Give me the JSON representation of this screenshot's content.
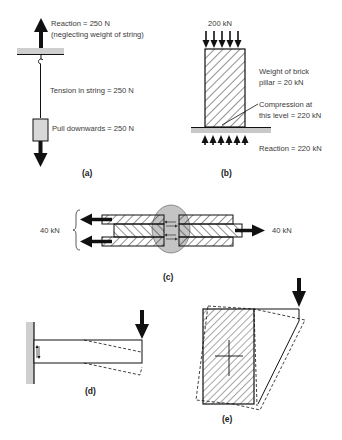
{
  "figure": {
    "panels": [
      {
        "id": "a",
        "caption": "(a)",
        "concept": "tension",
        "labels": {
          "reaction_line1": "Reaction = 250 N",
          "reaction_line2": "(neglecting weight of string)",
          "tension": "Tension in string = 250 N",
          "pull": "Pull downwards = 250 N"
        }
      },
      {
        "id": "b",
        "caption": "(b)",
        "concept": "compression",
        "labels": {
          "load": "200 kN",
          "weight_line1": "Weight of brick",
          "weight_line2": "pillar = 20 kN",
          "compression_line1": "Compression at",
          "compression_line2": "this level = 220 kN",
          "reaction": "Reaction = 220 kN"
        }
      },
      {
        "id": "c",
        "caption": "(c)",
        "concept": "shear (bolted lap joint)",
        "labels": {
          "left_force": "40 kN",
          "right_force": "40 kN"
        }
      },
      {
        "id": "d",
        "caption": "(d)",
        "concept": "bending (cantilever)"
      },
      {
        "id": "e",
        "caption": "(e)",
        "concept": "torsion"
      }
    ],
    "colors": {
      "line": "#1a1a1a",
      "ground": "#c8c8c8",
      "bolt": "#bdbdbd",
      "text": "#3a3a3a"
    }
  }
}
